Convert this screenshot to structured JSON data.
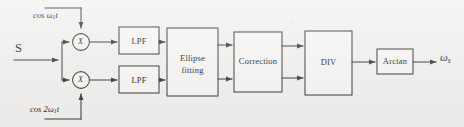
{
  "figure": {
    "kind": "block-diagram",
    "background_color": "#f2f1ef",
    "line_color": "#3a3a3a",
    "block_fill": "#f7f6f4"
  },
  "input": {
    "label": "S"
  },
  "carriers": {
    "top": {
      "prefix": "cos ",
      "omega": "ω",
      "sub": "1",
      "suffix": "t",
      "full": "cos ω1t"
    },
    "bottom": {
      "prefix": "cos 2",
      "omega": "ω",
      "sub": "1",
      "suffix": "t",
      "full": "cos 2ω1t"
    }
  },
  "multipliers": [
    {
      "name": "multiplier-top",
      "symbol": "X"
    },
    {
      "name": "multiplier-bottom",
      "symbol": "X"
    }
  ],
  "blocks": [
    {
      "id": "lpf-top",
      "label": "LPF"
    },
    {
      "id": "lpf-bottom",
      "label": "LPF"
    },
    {
      "id": "ellipse-fitting",
      "label_line1": "Ellipse",
      "label_line2": "fitting"
    },
    {
      "id": "correction",
      "label": "Correction"
    },
    {
      "id": "div",
      "label": "DIV"
    },
    {
      "id": "arctan",
      "label": "Arctan"
    }
  ],
  "output": {
    "omega": "ω",
    "sub": "s",
    "full": "ωs"
  }
}
